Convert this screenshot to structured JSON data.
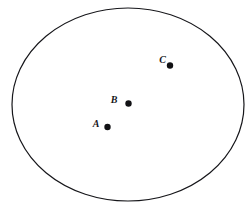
{
  "figure": {
    "type": "geometry-diagram",
    "background_color": "#ffffff",
    "stroke_color": "#16161a",
    "point_color": "#111114",
    "boundary": {
      "name": "ellipse-boundary",
      "shape": "ellipse",
      "center_x": 128,
      "center_y": 104.5,
      "radius_x": 116,
      "radius_y": 96.5,
      "stroke_width": 1.2
    },
    "points": [
      {
        "id": "point-a",
        "label": "A",
        "x": 107.5,
        "y": 127,
        "radius": 3.2,
        "label_x": 96,
        "label_y": 126.5
      },
      {
        "id": "point-b",
        "label": "B",
        "x": 128.5,
        "y": 103.5,
        "radius": 3.2,
        "label_x": 114,
        "label_y": 103
      },
      {
        "id": "point-c",
        "label": "C",
        "x": 170,
        "y": 65.5,
        "radius": 3.2,
        "label_x": 162.5,
        "label_y": 62.5
      }
    ]
  }
}
